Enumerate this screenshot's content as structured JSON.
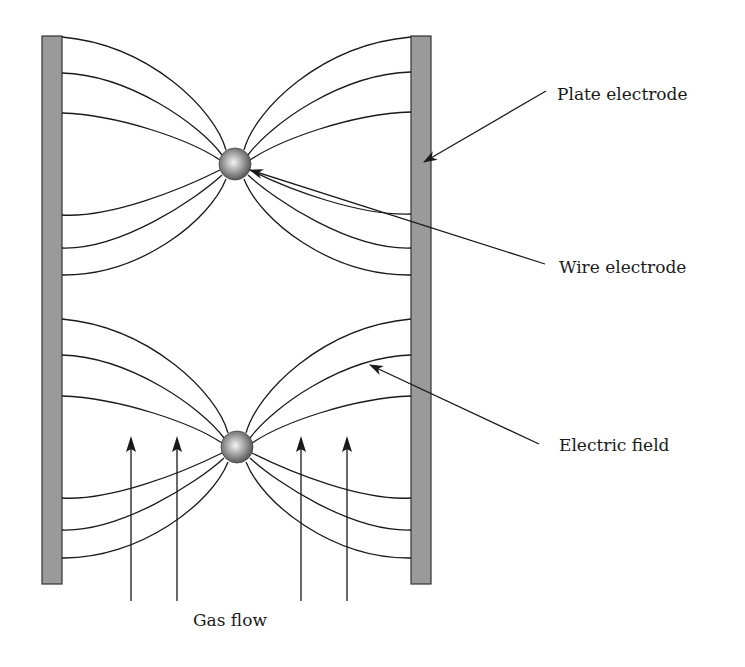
{
  "diagram": {
    "labels": {
      "plate_electrode": "Plate electrode",
      "wire_electrode": "Wire electrode",
      "electric_field": "Electric field",
      "gas_flow": "Gas flow"
    },
    "colors": {
      "plate_fill": "#9a9a9a",
      "plate_stroke": "#333333",
      "line": "#1a1a1a",
      "wire_light": "#f2f2f2",
      "wire_dark": "#555555",
      "background": "#ffffff"
    },
    "components": {
      "plates": [
        {
          "name": "left-plate",
          "x": 42,
          "y": 36,
          "width": 20,
          "height": 548
        },
        {
          "name": "right-plate",
          "x": 411,
          "y": 36,
          "width": 20,
          "height": 548
        }
      ],
      "wires": [
        {
          "name": "top-wire",
          "cx": 235,
          "cy": 164,
          "r": 16
        },
        {
          "name": "bottom-wire",
          "cx": 237,
          "cy": 447,
          "r": 16
        }
      ],
      "field_line_endpoints_y": {
        "top_wire": [
          37,
          73,
          113,
          215,
          248,
          275
        ],
        "bottom_wire": [
          319,
          355,
          396,
          498,
          530,
          558
        ]
      },
      "gas_flow_arrows_x": [
        131,
        177,
        301,
        347
      ]
    }
  }
}
